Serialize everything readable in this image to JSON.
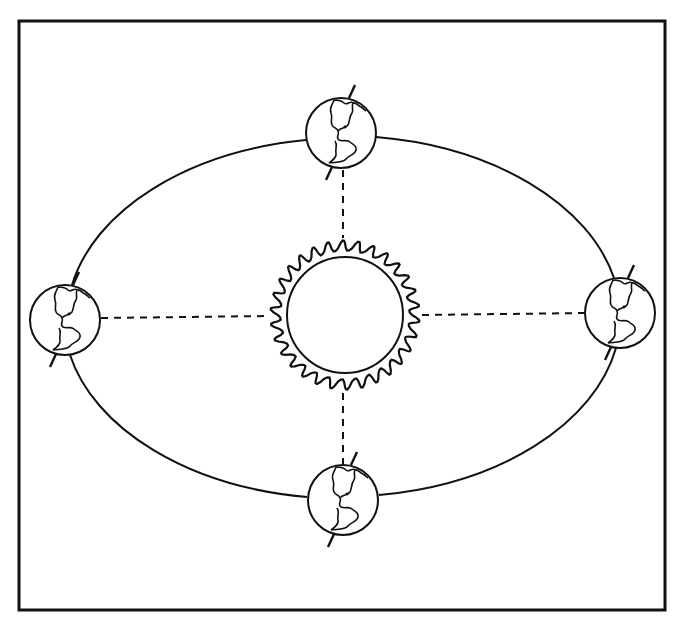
{
  "diagram": {
    "title": "",
    "colors": {
      "ink": "#111111",
      "background": "#ffffff"
    },
    "frame": {
      "x": 19,
      "y": 21,
      "width": 646,
      "height": 589
    },
    "orbit": {
      "cx": 343,
      "cy": 316,
      "rx": 280,
      "ry": 182
    },
    "sun": {
      "cx": 345,
      "cy": 315,
      "inner_r": 58,
      "outer_r": 77,
      "rays": 30,
      "icon": "sun-icon"
    },
    "earths": [
      {
        "position": "top",
        "cx": 341,
        "cy": 133,
        "r": 36,
        "icon": "earth-globe-icon"
      },
      {
        "position": "left",
        "cx": 65,
        "cy": 320,
        "r": 35,
        "icon": "earth-globe-icon"
      },
      {
        "position": "right",
        "cx": 620,
        "cy": 313,
        "r": 35,
        "icon": "earth-globe-icon"
      },
      {
        "position": "bottom",
        "cx": 343,
        "cy": 500,
        "r": 36,
        "icon": "earth-globe-icon"
      }
    ],
    "labels": []
  }
}
